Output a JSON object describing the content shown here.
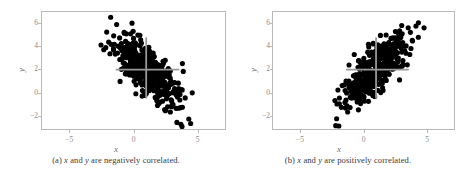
{
  "figure": {
    "background": "#ffffff",
    "point_color": "#000000",
    "crosshair_color": "#9a9a9a",
    "frame_color": "#b9b9b9"
  },
  "panels": [
    {
      "id": "panel-a",
      "caption_prefix": "(a)",
      "caption": "(a) x and y are negatively correlated.",
      "caption_parts": {
        "label": "(a)",
        "var1": "x",
        "mid": "and",
        "var2": "y",
        "tail": "are negatively correlated."
      },
      "xlabel": "x",
      "ylabel": "y"
    },
    {
      "id": "panel-b",
      "caption_prefix": "(b)",
      "caption": "(b) x and y are positively correlated.",
      "caption_parts": {
        "label": "(b)",
        "var1": "x",
        "mid": "and",
        "var2": "y",
        "tail": "are positively correlated."
      },
      "xlabel": "x",
      "ylabel": "y"
    }
  ],
  "chart_data": [
    {
      "type": "scatter",
      "title": "",
      "subtitle": "",
      "xlabel": "x",
      "ylabel": "y",
      "xlim": [
        -7.2,
        7.2
      ],
      "ylim": [
        -3.2,
        7.0
      ],
      "xticks": [
        -5,
        0,
        5
      ],
      "xticklabels": [
        "−5",
        "0",
        "5"
      ],
      "yticks": [
        -2,
        0,
        2,
        4,
        6
      ],
      "yticklabels": [
        "−2",
        "0",
        "2",
        "4",
        "6"
      ],
      "grid": false,
      "legend": null,
      "correlation": -0.75,
      "n_points": 420,
      "mean": [
        1.0,
        2.0
      ],
      "sd": [
        1.25,
        1.6
      ],
      "marker": {
        "size": 2.6,
        "color": "#000000",
        "shape": "circle"
      },
      "annotations": [
        {
          "kind": "crosshair-vertical",
          "x": 1.0,
          "y_from": -0.5,
          "y_to": 4.8,
          "color": "#9a9a9a"
        },
        {
          "kind": "crosshair-horizontal",
          "y": 2.0,
          "x_from": -1.4,
          "x_to": 3.6,
          "color": "#9a9a9a"
        }
      ],
      "seed": 11
    },
    {
      "type": "scatter",
      "title": "",
      "subtitle": "",
      "xlabel": "x",
      "ylabel": "y",
      "xlim": [
        -7.2,
        7.2
      ],
      "ylim": [
        -3.2,
        7.0
      ],
      "xticks": [
        -5,
        0,
        5
      ],
      "xticklabels": [
        "−5",
        "0",
        "5"
      ],
      "yticks": [
        -2,
        0,
        2,
        4,
        6
      ],
      "yticklabels": [
        "−2",
        "0",
        "2",
        "4",
        "6"
      ],
      "grid": false,
      "legend": null,
      "correlation": 0.75,
      "n_points": 420,
      "mean": [
        1.0,
        2.0
      ],
      "sd": [
        1.3,
        1.6
      ],
      "marker": {
        "size": 2.6,
        "color": "#000000",
        "shape": "circle"
      },
      "annotations": [
        {
          "kind": "crosshair-vertical",
          "x": 1.0,
          "y_from": -0.5,
          "y_to": 4.8,
          "color": "#9a9a9a"
        },
        {
          "kind": "crosshair-horizontal",
          "y": 2.0,
          "x_from": -1.4,
          "x_to": 3.6,
          "color": "#9a9a9a"
        }
      ],
      "seed": 29
    }
  ]
}
